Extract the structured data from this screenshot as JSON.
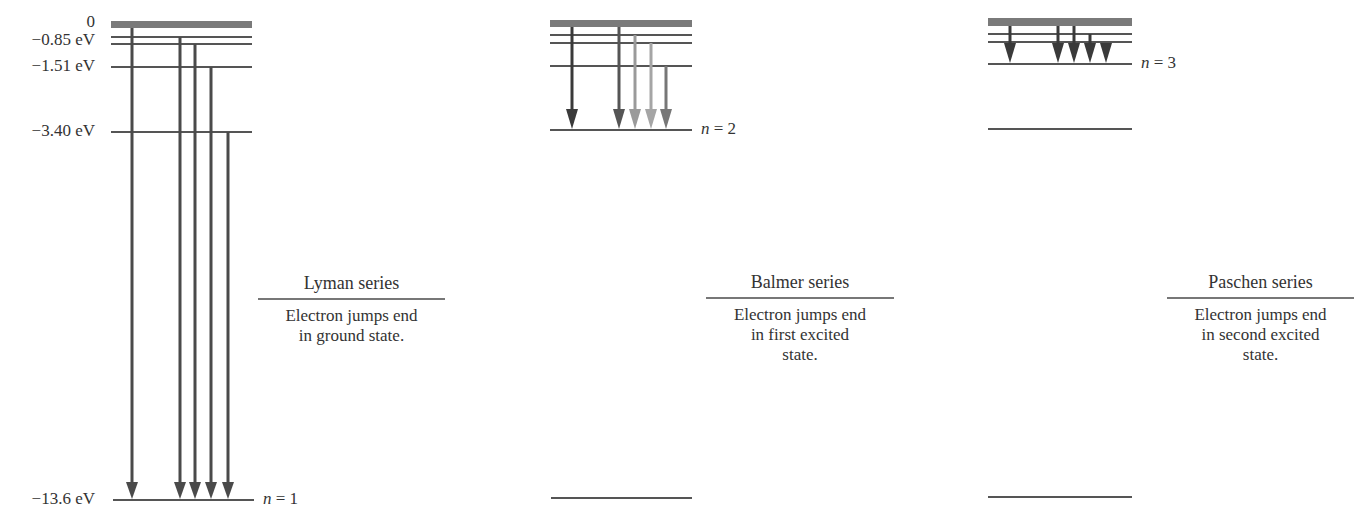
{
  "energy_labels": [
    {
      "text": "0",
      "y": 14
    },
    {
      "text": "−0.85 eV",
      "y": 32
    },
    {
      "text": "−1.51 eV",
      "y": 57
    },
    {
      "text": "−3.40 eV",
      "y": 122
    },
    {
      "text": "−13.6 eV",
      "y": 490
    }
  ],
  "panels": [
    {
      "name": "Lyman series",
      "description": [
        "Electron jumps end",
        "in ground state."
      ],
      "end_level_label": {
        "n_symbol": "n",
        "equals": " = 1"
      }
    },
    {
      "name": "Balmer series",
      "description": [
        "Electron jumps end",
        "in first excited",
        "state."
      ],
      "end_level_label": {
        "n_symbol": "n",
        "equals": " = 2"
      }
    },
    {
      "name": "Paschen series",
      "description": [
        "Electron jumps end",
        "in second excited",
        "state."
      ],
      "end_level_label": {
        "n_symbol": "n",
        "equals": " = 3"
      }
    }
  ],
  "colors": {
    "level_line": "#555555",
    "continuum_band": "#7a7a7a",
    "arrow_dark": "#4a4a4a",
    "arrow_medium": "#6a6a6a",
    "arrow_light": "#a0a0a0"
  }
}
